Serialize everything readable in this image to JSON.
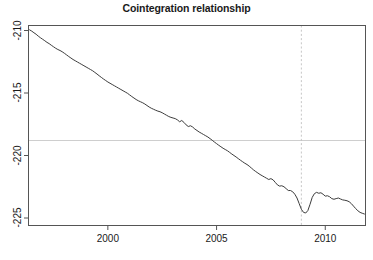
{
  "chart_data": {
    "type": "line",
    "title": "Cointegration relationship",
    "xlabel": "",
    "ylabel": "",
    "grid": false,
    "legend": null,
    "xlim": [
      1996.35,
      2011.85
    ],
    "ylim": [
      -225.6,
      -209.6
    ],
    "xticks": [
      2000,
      2005,
      2010
    ],
    "xtick_labels": [
      "2000",
      "2005",
      "2010"
    ],
    "yticks": [
      -210,
      -215,
      -220,
      -225
    ],
    "ytick_labels": [
      "-210",
      "-215",
      "-220",
      "-225"
    ],
    "series": [
      {
        "name": "cointegration residual",
        "color": "#3c3c3c",
        "x": [
          1996.4,
          1996.5,
          1996.6,
          1996.7,
          1996.8,
          1996.9,
          1997.0,
          1997.1,
          1997.2,
          1997.3,
          1997.4,
          1997.5,
          1997.6,
          1997.7,
          1997.8,
          1997.9,
          1998.0,
          1998.1,
          1998.2,
          1998.3,
          1998.4,
          1998.5,
          1998.6,
          1998.7,
          1998.8,
          1998.9,
          1999.0,
          1999.1,
          1999.2,
          1999.3,
          1999.4,
          1999.5,
          1999.6,
          1999.7,
          1999.8,
          1999.9,
          2000.0,
          2000.1,
          2000.2,
          2000.3,
          2000.4,
          2000.5,
          2000.6,
          2000.7,
          2000.8,
          2000.9,
          2001.0,
          2001.1,
          2001.2,
          2001.3,
          2001.4,
          2001.5,
          2001.6,
          2001.7,
          2001.8,
          2001.9,
          2002.0,
          2002.1,
          2002.2,
          2002.3,
          2002.4,
          2002.5,
          2002.6,
          2002.7,
          2002.8,
          2002.9,
          2003.0,
          2003.1,
          2003.2,
          2003.3,
          2003.4,
          2003.5,
          2003.6,
          2003.7,
          2003.8,
          2003.9,
          2004.0,
          2004.1,
          2004.2,
          2004.3,
          2004.4,
          2004.5,
          2004.6,
          2004.7,
          2004.8,
          2004.9,
          2005.0,
          2005.1,
          2005.2,
          2005.3,
          2005.4,
          2005.5,
          2005.6,
          2005.7,
          2005.8,
          2005.9,
          2006.0,
          2006.1,
          2006.2,
          2006.3,
          2006.4,
          2006.5,
          2006.6,
          2006.7,
          2006.8,
          2006.9,
          2007.0,
          2007.1,
          2007.2,
          2007.3,
          2007.4,
          2007.5,
          2007.6,
          2007.7,
          2007.8,
          2007.9,
          2008.0,
          2008.1,
          2008.2,
          2008.3,
          2008.4,
          2008.5,
          2008.6,
          2008.7,
          2008.8,
          2008.9,
          2009.0,
          2009.1,
          2009.2,
          2009.3,
          2009.4,
          2009.5,
          2009.6,
          2009.7,
          2009.8,
          2009.9,
          2010.0,
          2010.1,
          2010.2,
          2010.3,
          2010.4,
          2010.5,
          2010.6,
          2010.7,
          2010.8,
          2010.9,
          2011.0,
          2011.1,
          2011.2,
          2011.3,
          2011.4,
          2011.5,
          2011.6,
          2011.7,
          2011.8
        ],
        "y": [
          -209.95,
          -210.05,
          -210.18,
          -210.3,
          -210.45,
          -210.58,
          -210.7,
          -210.82,
          -210.95,
          -211.05,
          -211.18,
          -211.3,
          -211.42,
          -211.52,
          -211.6,
          -211.7,
          -211.82,
          -211.95,
          -212.08,
          -212.2,
          -212.32,
          -212.42,
          -212.52,
          -212.62,
          -212.72,
          -212.82,
          -212.92,
          -213.02,
          -213.12,
          -213.22,
          -213.35,
          -213.48,
          -213.62,
          -213.75,
          -213.88,
          -214.0,
          -214.12,
          -214.22,
          -214.32,
          -214.42,
          -214.52,
          -214.62,
          -214.72,
          -214.82,
          -214.92,
          -215.02,
          -215.15,
          -215.28,
          -215.4,
          -215.52,
          -215.62,
          -215.7,
          -215.78,
          -215.88,
          -216.0,
          -216.12,
          -216.22,
          -216.3,
          -216.38,
          -216.45,
          -216.5,
          -216.58,
          -216.68,
          -216.78,
          -216.88,
          -216.95,
          -217.0,
          -217.05,
          -217.15,
          -217.3,
          -217.2,
          -217.35,
          -217.55,
          -217.68,
          -217.62,
          -217.72,
          -217.88,
          -218.0,
          -218.12,
          -218.22,
          -218.32,
          -218.42,
          -218.52,
          -218.65,
          -218.78,
          -218.92,
          -219.05,
          -219.18,
          -219.3,
          -219.42,
          -219.52,
          -219.62,
          -219.75,
          -219.88,
          -220.0,
          -220.12,
          -220.25,
          -220.38,
          -220.5,
          -220.62,
          -220.72,
          -220.85,
          -221.0,
          -221.15,
          -221.28,
          -221.4,
          -221.52,
          -221.62,
          -221.72,
          -221.82,
          -221.92,
          -221.85,
          -221.95,
          -222.15,
          -222.35,
          -222.45,
          -222.42,
          -222.5,
          -222.65,
          -222.8,
          -222.8,
          -222.9,
          -223.1,
          -223.4,
          -223.85,
          -224.3,
          -224.55,
          -224.6,
          -224.4,
          -223.9,
          -223.35,
          -223.05,
          -222.95,
          -223.02,
          -222.98,
          -223.1,
          -223.25,
          -223.22,
          -223.3,
          -223.45,
          -223.5,
          -223.45,
          -223.4,
          -223.48,
          -223.55,
          -223.58,
          -223.62,
          -223.7,
          -223.85,
          -224.05,
          -224.25,
          -224.42,
          -224.55,
          -224.62,
          -224.68
        ]
      }
    ],
    "reference_lines": [
      {
        "orientation": "horizontal",
        "value": -218.8,
        "style": "solid",
        "color": "#c8c8c8"
      },
      {
        "orientation": "vertical",
        "value": 2008.9,
        "style": "dashed",
        "color": "#c0c0c0"
      }
    ]
  }
}
